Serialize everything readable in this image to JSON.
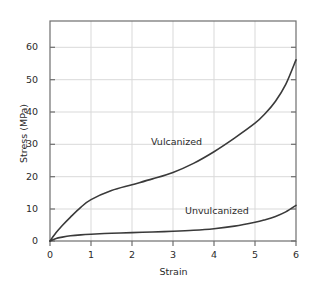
{
  "chart_data": {
    "type": "line",
    "title": "",
    "xlabel": "Strain",
    "ylabel": "Stress (MPa)",
    "xlim": [
      0,
      6
    ],
    "ylim": [
      0,
      68
    ],
    "xticks": [
      0,
      1,
      2,
      3,
      4,
      5,
      6
    ],
    "xtick_labels": [
      "0",
      "1",
      "2",
      "3",
      "4",
      "5",
      "6"
    ],
    "yticks": [
      0,
      10,
      20,
      30,
      40,
      50,
      60
    ],
    "ytick_labels": [
      "0",
      "10",
      "20",
      "30",
      "40",
      "50",
      "60"
    ],
    "grid": true,
    "legend_position": "inline-annotations",
    "series": [
      {
        "name": "Vulcanized",
        "color": "#3a3a3a",
        "x": [
          0,
          0.15,
          0.3,
          0.5,
          0.75,
          1.0,
          1.5,
          2.0,
          2.5,
          3.0,
          3.5,
          4.0,
          4.5,
          5.0,
          5.25,
          5.5,
          5.75,
          6.0
        ],
        "y": [
          0,
          2.6,
          4.8,
          7.4,
          10.4,
          12.8,
          15.6,
          17.4,
          19.2,
          21.2,
          24.0,
          27.6,
          31.8,
          36.4,
          39.4,
          43.2,
          48.4,
          56.0
        ]
      },
      {
        "name": "Unvulcanized",
        "color": "#3a3a3a",
        "x": [
          0,
          0.15,
          0.3,
          0.5,
          0.75,
          1.0,
          1.5,
          2.0,
          2.5,
          3.0,
          3.5,
          4.0,
          4.5,
          5.0,
          5.25,
          5.5,
          5.75,
          6.0
        ],
        "y": [
          0,
          0.8,
          1.2,
          1.6,
          1.9,
          2.1,
          2.4,
          2.6,
          2.8,
          3.0,
          3.3,
          3.8,
          4.6,
          5.8,
          6.6,
          7.6,
          9.0,
          11.0
        ]
      }
    ],
    "annotations": [
      {
        "text": "Vulcanized",
        "x": 2.5,
        "y": 29
      },
      {
        "text": "Unvulcanized",
        "x": 3.4,
        "y": 8.5
      }
    ],
    "colors": {
      "background": "#ffffff",
      "axis": "#6e6e6e",
      "grid": "#d9d9d9",
      "curve": "#3a3a3a",
      "text": "#2b2b2b"
    }
  }
}
